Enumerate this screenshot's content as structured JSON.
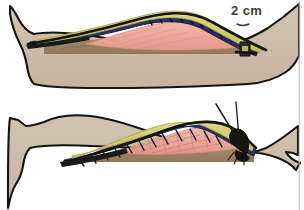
{
  "figure": {
    "panel_count": 2,
    "annotations": {
      "measurement_label": "2 cm"
    },
    "colors": {
      "skin": "#cdbdab",
      "skin_shadow": "#c0ae9b",
      "outline": "#151510",
      "fat_yellow": "#ccc468",
      "fat_yellow_light": "#ded57e",
      "suture_navy": "#2a2f63",
      "muscle_pink": "#e9a598",
      "muscle_pink_light": "#f0b6a9",
      "bone_tan": "#9c8160",
      "bone_tan_light": "#ad9170",
      "needle_black": "#1a1a16",
      "label_text": "#3b3b38",
      "edge_rule": "#b9b9b9",
      "background": "#ffffff"
    },
    "panels": [
      {
        "id": "upper-panel",
        "name": "flap-elevated-with-measurement",
        "description": "Limb in profile with skin-fat flap elevated, exposing pink muscle and tan bone; 2 cm marker at the right hinge.",
        "layers": [
          "skin",
          "subcutaneous-fat",
          "suture-line",
          "muscle",
          "bone"
        ],
        "label": "2 cm"
      },
      {
        "id": "lower-panel",
        "name": "flap-with-suture-needle",
        "description": "Limb in profile with flap elevated and a curved suture needle with thread at the right hinge.",
        "layers": [
          "skin",
          "subcutaneous-fat",
          "suture-line",
          "muscle-striated",
          "bone"
        ],
        "label": ""
      }
    ]
  }
}
